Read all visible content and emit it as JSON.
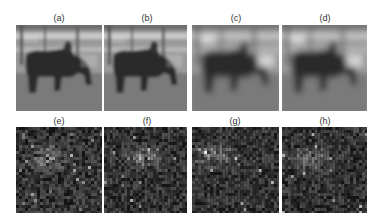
{
  "figure": {
    "top_row": [
      {
        "label": "(a)",
        "kind": "blurred-image",
        "blur": 1.4
      },
      {
        "label": "(b)",
        "kind": "blurred-image",
        "blur": 1.6
      },
      {
        "label": "(c)",
        "kind": "blurred-image",
        "blur": 3.2
      },
      {
        "label": "(d)",
        "kind": "blurred-image",
        "blur": 3.0
      }
    ],
    "bottom_row": [
      {
        "label": "(e)",
        "kind": "noise-heatmap",
        "seed": 11
      },
      {
        "label": "(f)",
        "kind": "noise-heatmap",
        "seed": 23
      },
      {
        "label": "(g)",
        "kind": "noise-heatmap",
        "seed": 37
      },
      {
        "label": "(h)",
        "kind": "noise-heatmap",
        "seed": 53
      }
    ],
    "colors": {
      "background": "#ffffff",
      "label_text": "#333333",
      "sky": "#9a9a9a",
      "fence": "#c8c8c8",
      "ground": "#7a7a7a",
      "animal": "#2a2a2a",
      "heatmap_bg": "#141414"
    }
  }
}
